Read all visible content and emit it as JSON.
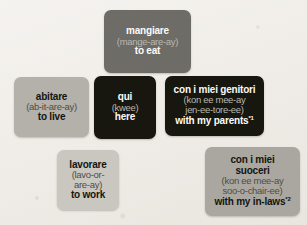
{
  "page": {
    "background_color": "#f2f0ec"
  },
  "cards": [
    {
      "id": "mangiare",
      "word": "mangiare",
      "pronunciation": [
        "(mange-are-ay)"
      ],
      "translation": "to eat",
      "footnote": "",
      "color": "#6e6c66",
      "text_style": "dark"
    },
    {
      "id": "abitare",
      "word": "abitare",
      "pronunciation": [
        "(ab-it-are-ay)"
      ],
      "translation": "to live",
      "footnote": "",
      "color": "#b3b1aa",
      "text_style": "light"
    },
    {
      "id": "qui",
      "word": "qui",
      "pronunciation": [
        "(kwee)"
      ],
      "translation": "here",
      "footnote": "",
      "color": "#17160f",
      "text_style": "dark"
    },
    {
      "id": "genitori",
      "word": "con i miei genitori",
      "pronunciation": [
        "(kon ee mee-ay",
        "jen-ee-tore-ee)"
      ],
      "translation": "with my parents",
      "footnote": "*1",
      "color": "#17160f",
      "text_style": "dark"
    },
    {
      "id": "lavorare",
      "word": "lavorare",
      "pronunciation": [
        "(lavo-or-",
        "are-ay)"
      ],
      "translation": "to work",
      "footnote": "",
      "color": "#c9c7c0",
      "text_style": "light"
    },
    {
      "id": "suoceri",
      "word": "con i miei",
      "word_line2": "suoceri",
      "pronunciation": [
        "(kon ee mee-ay",
        "soo-o-chair-ee)"
      ],
      "translation": "with my in-laws",
      "footnote": "*2",
      "color": "#a9a7a0",
      "text_style": "light"
    }
  ]
}
